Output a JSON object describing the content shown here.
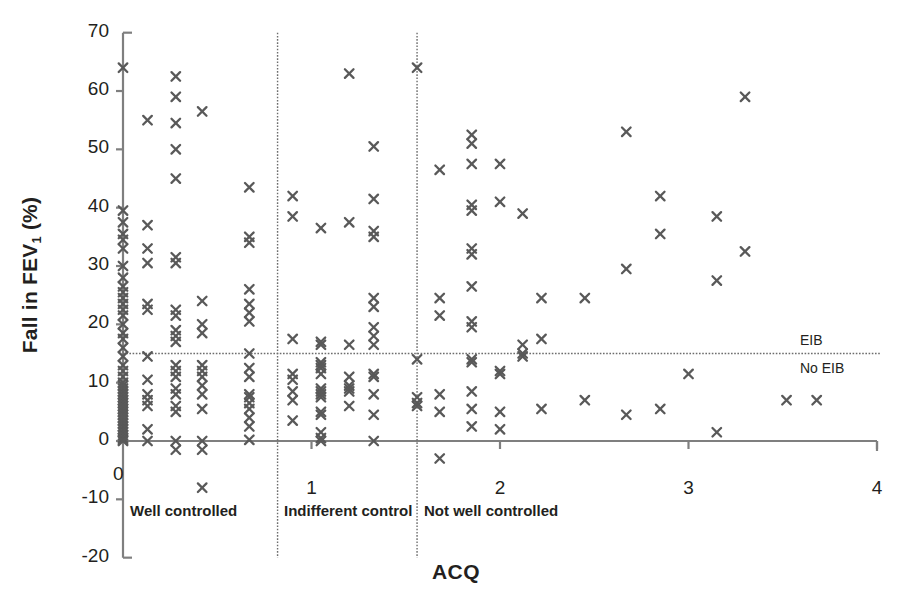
{
  "chart_data": {
    "type": "scatter",
    "title": "",
    "xlabel": "ACQ",
    "ylabel": "Fall in FEV₁ (%)",
    "xlim": [
      0,
      4
    ],
    "ylim": [
      -20,
      70
    ],
    "xticks": [
      "0",
      "1",
      "2",
      "3",
      "4"
    ],
    "xtick_values": [
      0,
      1,
      2,
      3,
      4
    ],
    "yticks": [
      "70",
      "60",
      "50",
      "40",
      "30",
      "20",
      "10",
      "0",
      "-10",
      "-20"
    ],
    "ytick_values": [
      70,
      60,
      50,
      40,
      30,
      20,
      10,
      0,
      -10,
      -20
    ],
    "grid": false,
    "legend": null,
    "marker": "x",
    "marker_color": "#595959",
    "axis_color": "#7f7f7f",
    "text_color": "#231f20",
    "threshold_line": {
      "orientation": "horizontal",
      "value": 15,
      "style": "dotted",
      "above_label": "EIB",
      "below_label": "No EIB"
    },
    "region_dividers": [
      {
        "value": 0.82,
        "style": "dotted"
      },
      {
        "value": 1.56,
        "style": "dotted"
      }
    ],
    "regions": [
      {
        "label": "Well controlled",
        "x": 0.9,
        "x_pixel": 130
      },
      {
        "label": "Indifferent control",
        "x": 0.85,
        "x_pixel": 284
      },
      {
        "label": "Not well controlled",
        "x": 1.6,
        "x_pixel": 424
      }
    ],
    "origin_label": "0",
    "points": [
      [
        0.0,
        64.0
      ],
      [
        0.0,
        39.5
      ],
      [
        0.0,
        37.5
      ],
      [
        0.0,
        35.5
      ],
      [
        0.0,
        34.5
      ],
      [
        0.0,
        33.0
      ],
      [
        0.0,
        30.0
      ],
      [
        0.0,
        28.0
      ],
      [
        0.0,
        26.5
      ],
      [
        0.0,
        25.5
      ],
      [
        0.0,
        24.5
      ],
      [
        0.0,
        23.5
      ],
      [
        0.0,
        22.5
      ],
      [
        0.0,
        21.5
      ],
      [
        0.0,
        20.0
      ],
      [
        0.0,
        18.5
      ],
      [
        0.0,
        17.5
      ],
      [
        0.0,
        16.0
      ],
      [
        0.0,
        14.5
      ],
      [
        0.0,
        13.0
      ],
      [
        0.0,
        12.0
      ],
      [
        0.0,
        11.0
      ],
      [
        0.0,
        10.0
      ],
      [
        0.0,
        9.5
      ],
      [
        0.0,
        9.0
      ],
      [
        0.0,
        8.5
      ],
      [
        0.0,
        8.0
      ],
      [
        0.0,
        7.5
      ],
      [
        0.0,
        7.0
      ],
      [
        0.0,
        6.5
      ],
      [
        0.0,
        6.0
      ],
      [
        0.0,
        5.5
      ],
      [
        0.0,
        5.0
      ],
      [
        0.0,
        4.5
      ],
      [
        0.0,
        4.0
      ],
      [
        0.0,
        3.5
      ],
      [
        0.0,
        3.0
      ],
      [
        0.0,
        2.5
      ],
      [
        0.0,
        2.0
      ],
      [
        0.0,
        1.5
      ],
      [
        0.0,
        1.0
      ],
      [
        0.0,
        0.5
      ],
      [
        0.0,
        0.2
      ],
      [
        0.0,
        0.0
      ],
      [
        0.13,
        55.0
      ],
      [
        0.13,
        37.0
      ],
      [
        0.13,
        33.0
      ],
      [
        0.13,
        30.5
      ],
      [
        0.13,
        23.5
      ],
      [
        0.13,
        22.5
      ],
      [
        0.13,
        14.5
      ],
      [
        0.13,
        10.5
      ],
      [
        0.13,
        8.0
      ],
      [
        0.13,
        7.0
      ],
      [
        0.13,
        6.0
      ],
      [
        0.13,
        2.0
      ],
      [
        0.13,
        0.0
      ],
      [
        0.28,
        62.5
      ],
      [
        0.28,
        59.0
      ],
      [
        0.28,
        54.5
      ],
      [
        0.28,
        50.0
      ],
      [
        0.28,
        45.0
      ],
      [
        0.28,
        31.5
      ],
      [
        0.28,
        30.5
      ],
      [
        0.28,
        22.5
      ],
      [
        0.28,
        21.5
      ],
      [
        0.28,
        19.0
      ],
      [
        0.28,
        18.0
      ],
      [
        0.28,
        17.0
      ],
      [
        0.28,
        13.0
      ],
      [
        0.28,
        12.0
      ],
      [
        0.28,
        11.0
      ],
      [
        0.28,
        9.0
      ],
      [
        0.28,
        8.0
      ],
      [
        0.28,
        6.0
      ],
      [
        0.28,
        5.0
      ],
      [
        0.28,
        0.0
      ],
      [
        0.28,
        -1.5
      ],
      [
        0.42,
        56.5
      ],
      [
        0.42,
        24.0
      ],
      [
        0.42,
        20.0
      ],
      [
        0.42,
        18.5
      ],
      [
        0.42,
        13.0
      ],
      [
        0.42,
        12.0
      ],
      [
        0.42,
        11.0
      ],
      [
        0.42,
        9.5
      ],
      [
        0.42,
        8.0
      ],
      [
        0.42,
        5.5
      ],
      [
        0.42,
        0.0
      ],
      [
        0.42,
        -1.5
      ],
      [
        0.42,
        -8.0
      ],
      [
        0.67,
        43.5
      ],
      [
        0.67,
        35.0
      ],
      [
        0.67,
        34.0
      ],
      [
        0.67,
        26.0
      ],
      [
        0.67,
        23.5
      ],
      [
        0.67,
        22.0
      ],
      [
        0.67,
        20.5
      ],
      [
        0.67,
        15.0
      ],
      [
        0.67,
        12.5
      ],
      [
        0.67,
        11.0
      ],
      [
        0.67,
        8.0
      ],
      [
        0.67,
        7.5
      ],
      [
        0.67,
        6.5
      ],
      [
        0.67,
        5.5
      ],
      [
        0.67,
        4.0
      ],
      [
        0.67,
        2.5
      ],
      [
        0.67,
        0.2
      ],
      [
        0.9,
        42.0
      ],
      [
        0.9,
        38.5
      ],
      [
        0.9,
        17.5
      ],
      [
        0.9,
        11.5
      ],
      [
        0.9,
        10.5
      ],
      [
        0.9,
        8.5
      ],
      [
        0.9,
        7.0
      ],
      [
        0.9,
        3.5
      ],
      [
        1.05,
        36.5
      ],
      [
        1.05,
        17.0
      ],
      [
        1.05,
        16.5
      ],
      [
        1.05,
        13.5
      ],
      [
        1.05,
        13.0
      ],
      [
        1.05,
        12.5
      ],
      [
        1.05,
        11.5
      ],
      [
        1.05,
        9.0
      ],
      [
        1.05,
        8.5
      ],
      [
        1.05,
        8.0
      ],
      [
        1.05,
        7.5
      ],
      [
        1.05,
        5.0
      ],
      [
        1.05,
        4.5
      ],
      [
        1.05,
        1.5
      ],
      [
        1.05,
        0.5
      ],
      [
        1.05,
        0.0
      ],
      [
        1.2,
        63.0
      ],
      [
        1.2,
        37.5
      ],
      [
        1.2,
        16.5
      ],
      [
        1.2,
        11.0
      ],
      [
        1.2,
        9.5
      ],
      [
        1.2,
        9.0
      ],
      [
        1.2,
        8.5
      ],
      [
        1.2,
        6.0
      ],
      [
        1.33,
        50.5
      ],
      [
        1.33,
        41.5
      ],
      [
        1.33,
        36.0
      ],
      [
        1.33,
        35.0
      ],
      [
        1.33,
        24.5
      ],
      [
        1.33,
        23.0
      ],
      [
        1.33,
        19.5
      ],
      [
        1.33,
        18.0
      ],
      [
        1.33,
        16.5
      ],
      [
        1.33,
        11.5
      ],
      [
        1.33,
        11.0
      ],
      [
        1.33,
        8.0
      ],
      [
        1.33,
        4.5
      ],
      [
        1.33,
        0.0
      ],
      [
        1.56,
        64.0
      ],
      [
        1.56,
        14.0
      ],
      [
        1.56,
        7.5
      ],
      [
        1.56,
        6.5
      ],
      [
        1.56,
        6.0
      ],
      [
        1.68,
        46.5
      ],
      [
        1.68,
        24.5
      ],
      [
        1.68,
        21.5
      ],
      [
        1.68,
        8.0
      ],
      [
        1.68,
        5.0
      ],
      [
        1.68,
        -3.0
      ],
      [
        1.85,
        52.5
      ],
      [
        1.85,
        51.0
      ],
      [
        1.85,
        47.5
      ],
      [
        1.85,
        40.5
      ],
      [
        1.85,
        39.5
      ],
      [
        1.85,
        33.0
      ],
      [
        1.85,
        32.0
      ],
      [
        1.85,
        26.5
      ],
      [
        1.85,
        20.5
      ],
      [
        1.85,
        19.5
      ],
      [
        1.85,
        14.0
      ],
      [
        1.85,
        13.5
      ],
      [
        1.85,
        8.5
      ],
      [
        1.85,
        5.5
      ],
      [
        1.85,
        2.5
      ],
      [
        2.0,
        47.5
      ],
      [
        2.0,
        41.0
      ],
      [
        2.0,
        12.0
      ],
      [
        2.0,
        11.5
      ],
      [
        2.0,
        5.0
      ],
      [
        2.0,
        2.0
      ],
      [
        2.12,
        39.0
      ],
      [
        2.12,
        16.5
      ],
      [
        2.12,
        15.0
      ],
      [
        2.12,
        14.5
      ],
      [
        2.22,
        24.5
      ],
      [
        2.22,
        17.5
      ],
      [
        2.22,
        5.5
      ],
      [
        2.45,
        24.5
      ],
      [
        2.45,
        7.0
      ],
      [
        2.67,
        53.0
      ],
      [
        2.67,
        29.5
      ],
      [
        2.67,
        4.5
      ],
      [
        2.85,
        42.0
      ],
      [
        2.85,
        35.5
      ],
      [
        2.85,
        5.5
      ],
      [
        3.0,
        11.5
      ],
      [
        3.15,
        38.5
      ],
      [
        3.15,
        27.5
      ],
      [
        3.15,
        1.5
      ],
      [
        3.3,
        59.0
      ],
      [
        3.3,
        32.5
      ],
      [
        3.52,
        7.0
      ],
      [
        3.68,
        7.0
      ]
    ]
  },
  "geometry": {
    "x0_pixel": 123,
    "x_unit_pixels": 188.5,
    "y0_pixel": 441,
    "y_unit_pixels": 5.833
  }
}
